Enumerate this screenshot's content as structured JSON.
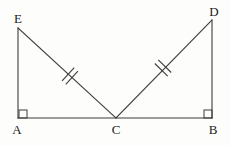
{
  "figure": {
    "kind": "geometry-diagram",
    "background_color": "#fdfdfb",
    "stroke_color": "#3c3c3c",
    "label_color": "#1b1b1b",
    "canvas": {
      "width": 230,
      "height": 146
    },
    "vertices": [
      {
        "id": "E",
        "label": "E",
        "x": 18,
        "y": 28,
        "label_x": 18,
        "label_y": 18
      },
      {
        "id": "D",
        "label": "D",
        "x": 212,
        "y": 20,
        "label_x": 214,
        "label_y": 11
      },
      {
        "id": "A",
        "label": "A",
        "x": 18,
        "y": 118,
        "label_x": 17,
        "label_y": 129
      },
      {
        "id": "C",
        "label": "C",
        "x": 116,
        "y": 118,
        "label_x": 116,
        "label_y": 129
      },
      {
        "id": "B",
        "label": "B",
        "x": 212,
        "y": 118,
        "label_x": 213,
        "label_y": 129
      }
    ],
    "segments": [
      {
        "id": "EA",
        "from": "E",
        "to": "A",
        "x1": 18,
        "y1": 28,
        "x2": 18,
        "y2": 118,
        "ticks": 0
      },
      {
        "id": "AB",
        "from": "A",
        "to": "B",
        "x1": 18,
        "y1": 118,
        "x2": 212,
        "y2": 118,
        "ticks": 0
      },
      {
        "id": "DB",
        "from": "D",
        "to": "B",
        "x1": 212,
        "y1": 20,
        "x2": 212,
        "y2": 118,
        "ticks": 0
      },
      {
        "id": "EC",
        "from": "E",
        "to": "C",
        "x1": 18,
        "y1": 28,
        "x2": 116,
        "y2": 118,
        "ticks": 2
      },
      {
        "id": "CD",
        "from": "C",
        "to": "D",
        "x1": 116,
        "y1": 118,
        "x2": 212,
        "y2": 20,
        "ticks": 2
      }
    ],
    "tick_marks": [
      {
        "on_segment": "EC",
        "count": 2,
        "center_x": 70,
        "center_y": 76,
        "half_len": 9,
        "spacing": 5
      },
      {
        "on_segment": "CD",
        "count": 2,
        "center_x": 163,
        "center_y": 68,
        "half_len": 9,
        "spacing": 5
      }
    ],
    "right_angles": [
      {
        "at": "A",
        "x": 19,
        "y": 110,
        "size": 8,
        "orientation": "up-right"
      },
      {
        "at": "B",
        "x": 204,
        "y": 110,
        "size": 8,
        "orientation": "up-left"
      }
    ],
    "congruence_note": "EC and CD are marked congruent (double tick marks)"
  }
}
